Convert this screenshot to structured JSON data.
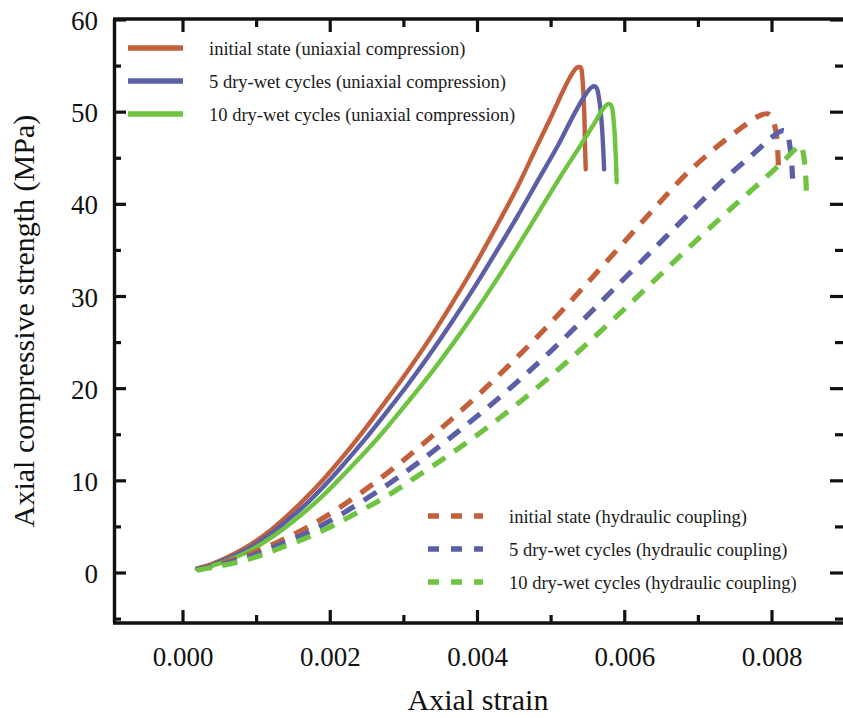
{
  "chart_data": {
    "type": "line",
    "title": "",
    "xlabel": "Axial strain",
    "ylabel": "Axial compressive strength (MPa)",
    "xlim": [
      -0.00025,
      0.00895
    ],
    "ylim": [
      -5.4,
      60
    ],
    "xticks": [
      0.0,
      0.002,
      0.004,
      0.006,
      0.008
    ],
    "xticklabels": [
      "0.000",
      "0.002",
      "0.004",
      "0.006",
      "0.008"
    ],
    "yticks": [
      0,
      10,
      20,
      30,
      40,
      50,
      60
    ],
    "yticklabels": [
      "0",
      "10",
      "20",
      "30",
      "40",
      "50",
      "60"
    ],
    "minor_ticks": true,
    "grid": false,
    "legend_position": [
      "upper-left",
      "lower-right"
    ],
    "colors": {
      "initial": "#c2603c",
      "cycles5": "#5a5fa6",
      "cycles10": "#6ec340"
    },
    "series": [
      {
        "name": "initial state (uniaxial compression)",
        "color": "#c2603c",
        "style": "solid",
        "legend_block": "upper-left",
        "x": [
          0.00019,
          0.0004,
          0.00065,
          0.0009,
          0.00115,
          0.0014,
          0.00165,
          0.0019,
          0.00215,
          0.00245,
          0.00275,
          0.00305,
          0.00335,
          0.00365,
          0.00395,
          0.00425,
          0.00455,
          0.0048,
          0.005,
          0.00515,
          0.00525,
          0.00532,
          0.00537,
          0.00541,
          0.00543,
          0.00545,
          0.00546,
          0.00547
        ],
        "y": [
          0.5,
          1.0,
          1.9,
          3.0,
          4.4,
          6.1,
          8.0,
          10.1,
          12.4,
          15.4,
          18.6,
          21.9,
          25.4,
          29.2,
          33.2,
          37.5,
          42.0,
          46.2,
          49.5,
          52.1,
          53.7,
          54.6,
          54.9,
          54.7,
          53.2,
          50.0,
          46.5,
          43.8
        ]
      },
      {
        "name": "5 dry-wet cycles (uniaxial compression)",
        "color": "#5a5fa6",
        "style": "solid",
        "legend_block": "upper-left",
        "x": [
          0.00019,
          0.0004,
          0.00065,
          0.0009,
          0.00115,
          0.0014,
          0.00165,
          0.0019,
          0.00215,
          0.00245,
          0.00275,
          0.00305,
          0.00335,
          0.00365,
          0.00395,
          0.00425,
          0.00455,
          0.00485,
          0.0051,
          0.0053,
          0.00545,
          0.00555,
          0.00562,
          0.00566,
          0.00569,
          0.00571,
          0.00572
        ],
        "y": [
          0.45,
          0.9,
          1.7,
          2.7,
          4.0,
          5.6,
          7.3,
          9.3,
          11.5,
          14.3,
          17.3,
          20.4,
          23.7,
          27.2,
          30.9,
          34.8,
          38.8,
          43.0,
          46.5,
          49.6,
          51.7,
          52.7,
          52.6,
          51.0,
          48.5,
          45.6,
          43.8
        ]
      },
      {
        "name": "10 dry-wet cycles (uniaxial compression)",
        "color": "#6ec340",
        "style": "solid",
        "legend_block": "upper-left",
        "x": [
          0.00019,
          0.0004,
          0.00065,
          0.0009,
          0.00115,
          0.0014,
          0.00165,
          0.0019,
          0.00215,
          0.00245,
          0.00275,
          0.00305,
          0.00335,
          0.00365,
          0.00395,
          0.00425,
          0.00455,
          0.00485,
          0.00515,
          0.0054,
          0.00558,
          0.0057,
          0.00578,
          0.00583,
          0.00586,
          0.00588,
          0.00589
        ],
        "y": [
          0.4,
          0.8,
          1.5,
          2.4,
          3.6,
          5.0,
          6.6,
          8.4,
          10.4,
          12.9,
          15.6,
          18.5,
          21.5,
          24.7,
          28.1,
          31.7,
          35.5,
          39.4,
          43.3,
          46.4,
          48.7,
          50.3,
          50.9,
          50.4,
          48.0,
          44.9,
          42.4
        ]
      },
      {
        "name": "initial state (hydraulic coupling)",
        "color": "#c2603c",
        "style": "dashed",
        "legend_block": "lower-right",
        "x": [
          0.00019,
          0.00045,
          0.00075,
          0.00105,
          0.00135,
          0.0017,
          0.00205,
          0.0024,
          0.0028,
          0.0032,
          0.00365,
          0.0041,
          0.00455,
          0.005,
          0.00545,
          0.0059,
          0.00635,
          0.0068,
          0.0072,
          0.00755,
          0.0078,
          0.00795,
          0.00802,
          0.00806,
          0.00808,
          0.00809
        ],
        "y": [
          0.4,
          0.9,
          1.6,
          2.5,
          3.6,
          5.0,
          6.7,
          8.6,
          11.0,
          13.6,
          16.7,
          20.0,
          23.5,
          27.2,
          31.1,
          35.1,
          39.1,
          43.0,
          45.9,
          48.1,
          49.5,
          49.8,
          49.0,
          47.5,
          45.5,
          43.4
        ]
      },
      {
        "name": "5 dry-wet cycles (hydraulic coupling)",
        "color": "#5a5fa6",
        "style": "dashed",
        "legend_block": "lower-right",
        "x": [
          0.00019,
          0.00045,
          0.00075,
          0.00105,
          0.00135,
          0.0017,
          0.00205,
          0.0024,
          0.0028,
          0.0032,
          0.00365,
          0.0041,
          0.00455,
          0.005,
          0.00545,
          0.0059,
          0.0064,
          0.0069,
          0.00735,
          0.00775,
          0.008,
          0.00815,
          0.00822,
          0.00826,
          0.00828
        ],
        "y": [
          0.35,
          0.8,
          1.4,
          2.2,
          3.2,
          4.4,
          5.9,
          7.6,
          9.7,
          12.0,
          14.8,
          17.7,
          20.8,
          24.1,
          27.6,
          31.2,
          35.2,
          39.2,
          42.7,
          45.5,
          47.3,
          48.0,
          47.3,
          45.2,
          42.8
        ]
      },
      {
        "name": "10 dry-wet cycles (hydraulic coupling)",
        "color": "#6ec340",
        "style": "dashed",
        "legend_block": "lower-right",
        "x": [
          0.00019,
          0.00045,
          0.00075,
          0.00105,
          0.00135,
          0.0017,
          0.00205,
          0.0024,
          0.0028,
          0.0032,
          0.00365,
          0.0041,
          0.00455,
          0.005,
          0.00545,
          0.00595,
          0.00645,
          0.00695,
          0.00745,
          0.0079,
          0.00818,
          0.00832,
          0.0084,
          0.00845,
          0.00847
        ],
        "y": [
          0.3,
          0.7,
          1.2,
          1.9,
          2.8,
          3.9,
          5.2,
          6.7,
          8.5,
          10.6,
          13.0,
          15.6,
          18.4,
          21.4,
          24.6,
          28.3,
          32.1,
          35.9,
          39.6,
          42.8,
          44.9,
          46.0,
          46.3,
          44.0,
          40.8
        ]
      }
    ]
  },
  "legend_top": {
    "items": [
      {
        "label": "initial state (uniaxial compression)",
        "color": "#c2603c",
        "style": "solid"
      },
      {
        "label": "5 dry-wet cycles (uniaxial compression)",
        "color": "#5a5fa6",
        "style": "solid"
      },
      {
        "label": "10 dry-wet cycles (uniaxial compression)",
        "color": "#6ec340",
        "style": "solid"
      }
    ]
  },
  "legend_bottom": {
    "items": [
      {
        "label": "initial state (hydraulic coupling)",
        "color": "#c2603c",
        "style": "dashed"
      },
      {
        "label": "5 dry-wet cycles (hydraulic coupling)",
        "color": "#5a5fa6",
        "style": "dashed"
      },
      {
        "label": "10 dry-wet cycles (hydraulic coupling)",
        "color": "#6ec340",
        "style": "dashed"
      }
    ]
  }
}
